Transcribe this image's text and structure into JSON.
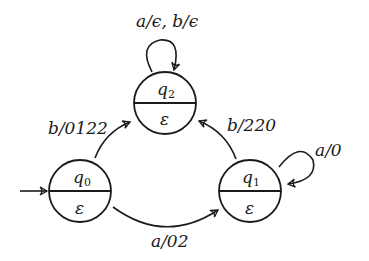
{
  "diagram": {
    "type": "Moore machine state diagram",
    "states": [
      {
        "id": "q0",
        "name": "q",
        "sub": "0",
        "output": "ε",
        "initial": true
      },
      {
        "id": "q1",
        "name": "q",
        "sub": "1",
        "output": "ε"
      },
      {
        "id": "q2",
        "name": "q",
        "sub": "2",
        "output": "ε"
      }
    ],
    "transitions": [
      {
        "from": "q0",
        "to": "q2",
        "label": "b/0122"
      },
      {
        "from": "q0",
        "to": "q1",
        "label": "a/02"
      },
      {
        "from": "q1",
        "to": "q2",
        "label": "b/220"
      },
      {
        "from": "q1",
        "to": "q1",
        "label": "a/0"
      },
      {
        "from": "q2",
        "to": "q2",
        "label": "a/ϵ, b/ϵ"
      }
    ]
  }
}
